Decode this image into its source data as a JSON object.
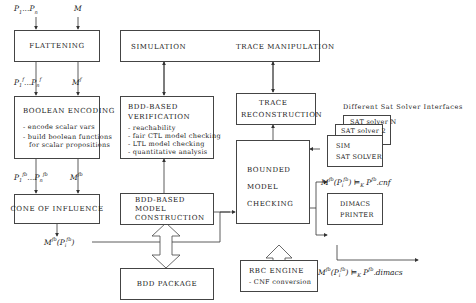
{
  "inputs": {
    "properties": "P1...Pn",
    "model": "M"
  },
  "boxes": {
    "flattening": "FLATTENING",
    "boolean_encoding": {
      "title": "BOOLEAN ENCODING",
      "items": [
        "- encode scalar vars",
        "- build boolean functions",
        "  for scalar propositions"
      ]
    },
    "cone_of_influence": "CONE OF INFLUENCE",
    "simulation": "SIMULATION",
    "trace_manipulation": "TRACE MANIPULATION",
    "bdd_verification": {
      "title_1": "BDD-BASED",
      "title_2": "VERIFICATION",
      "items": [
        "- reachability",
        "- fair CTL model checking",
        "- LTL model checking",
        "- quantitative analysis"
      ]
    },
    "bdd_model_construction": [
      "BDD-BASED",
      "MODEL",
      "CONSTRUCTION"
    ],
    "bdd_package": "BDD PACKAGE",
    "trace_reconstruction": [
      "TRACE",
      "RECONSTRUCTION"
    ],
    "bounded_model_checking": [
      "BOUNDED",
      "MODEL",
      "CHECKING"
    ],
    "rbc_engine": {
      "title": "RBC ENGINE",
      "item": "- CNF conversion"
    },
    "sat_solver_n": "SAT solver N",
    "sat_solver_2": "SAT solver 2",
    "sim_sat_solver": [
      "SIM",
      "SAT SOLVER"
    ],
    "dimacs_printer": [
      "DIMACS",
      "PRINTER"
    ]
  },
  "labels": {
    "sat_interfaces_title": "Different Sat Solver Interfaces",
    "after_flattening_props": "P1f...Pnf",
    "after_flattening_model": "Mf",
    "after_encoding_props": "P1fb...Pnfb",
    "after_encoding_model": "Mfb",
    "coi_output": "Mfb(Pifb)",
    "cnf_output": "Mfb(Pifb) |=K Pfb.cnf",
    "dimacs_output": "Mfb(Pifb) |=K Pfb.dimacs"
  }
}
